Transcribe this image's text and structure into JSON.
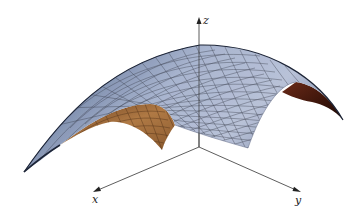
{
  "figure": {
    "type": "3d-surface",
    "surface_colors": {
      "top": "#a9b5cf",
      "top_shadow": "#3e4f6e",
      "underside": "#b07a45",
      "underside_dark": "#4a1e10",
      "mesh": "#3a3f4a"
    },
    "axis_color": "#333333"
  },
  "axes": {
    "x": {
      "label": "x"
    },
    "y": {
      "label": "y"
    },
    "z": {
      "label": "z"
    }
  }
}
